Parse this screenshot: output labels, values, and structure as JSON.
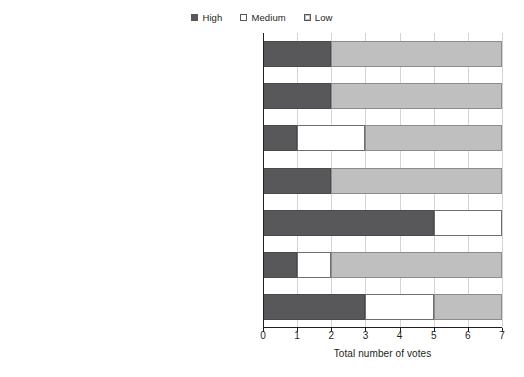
{
  "chart_data": {
    "type": "bar",
    "orientation": "horizontal",
    "stacked": true,
    "title": "",
    "xlabel": "Total number of votes",
    "ylabel": "",
    "xlim": [
      0,
      7
    ],
    "xticks": [
      "0",
      "1",
      "2",
      "3",
      "4",
      "5",
      "6",
      "7"
    ],
    "grid": true,
    "legend_position": "top-center",
    "legend": [
      "High",
      "Medium",
      "Low"
    ],
    "categories": [
      "Dealer",
      "Automotive insurers (e.g., Allstate, progressive, state farm)",
      "Telecom players (e.g., Telefónica, Vodafone, AT & T, Verizon, Deutsche telekom)",
      "New mobility service providers (e.g.,Uber, Lyft, Zipcar, Car2Go)",
      "Digital players (e.g., Apple, Google, Microsoft, NAVTEQ Spotify, Tom Tom)",
      "Automotive suppliers (e.g., Bosch, Continental, Delphi, Denso, Hella, Magna)",
      "Premium and value OEMs (e.g., Audi, BMW, Mercedes-Benz, Toyota, VW, Ford, GM"
    ],
    "category_lines": [
      [
        "Dealer"
      ],
      [
        "Automotive insurers (e.g., Allstate,",
        "progressive, state farm)"
      ],
      [
        "Telecom players (e.g., Telefónica, Vodafone, AT & T,",
        "Verizon, Deutsche telekom)"
      ],
      [
        "New mobility service providers (e.g.,Uber, Lyft, Zipcar,",
        "Car2Go)"
      ],
      [
        "Digital players (e.g., Apple, Google, Microsoft, NAVTEQ",
        "Spotify, Tom Tom)"
      ],
      [
        "Automotive suppliers (e.g., Bosch, Continental, Delphi,",
        "Denso, Hella, Magna)"
      ],
      [
        "Premium and value OEMs (e.g., Audi, BMW,",
        "Mercedes-Benz, Toyota, VW, Ford, GM"
      ]
    ],
    "series": [
      {
        "name": "High",
        "color": "#58585a",
        "values": [
          2,
          2,
          1,
          2,
          5,
          1,
          3
        ]
      },
      {
        "name": "Medium",
        "color": "#ffffff",
        "values": [
          0,
          0,
          2,
          0,
          2,
          1,
          2
        ]
      },
      {
        "name": "Low",
        "color": "#bfbfbf",
        "values": [
          5,
          5,
          4,
          5,
          0,
          5,
          2
        ]
      }
    ],
    "totals": [
      7,
      7,
      7,
      7,
      7,
      7,
      7
    ]
  },
  "colors": {
    "high": "#58585a",
    "medium": "#ffffff",
    "low": "#bfbfbf",
    "axis": "#231f20",
    "grid": "#d4d4d4",
    "background": "#ffffff"
  }
}
